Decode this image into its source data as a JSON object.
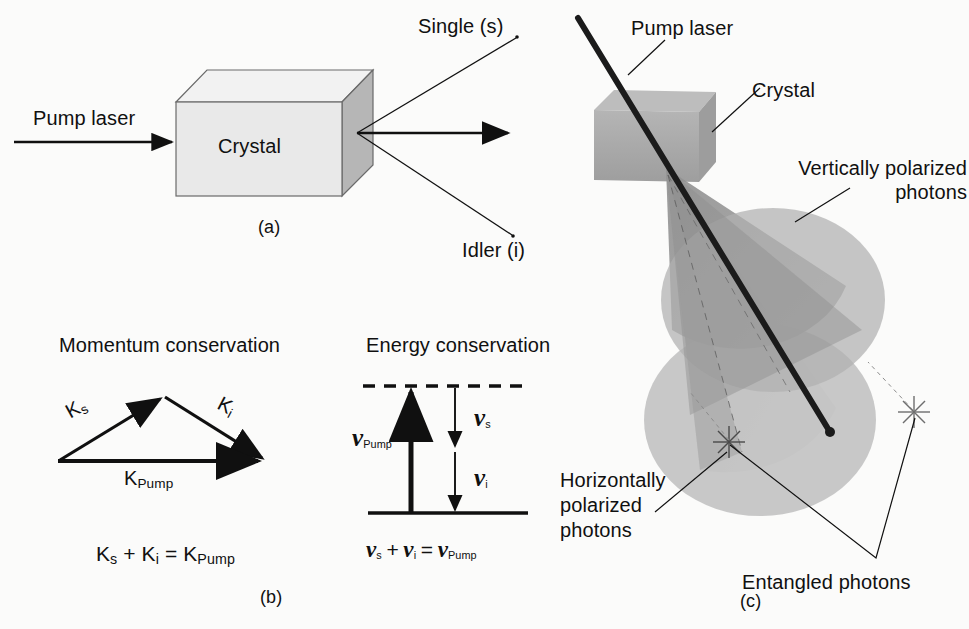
{
  "figure": {
    "panels": [
      "(a)",
      "(b)",
      "(c)"
    ],
    "colors": {
      "ink": "#101010",
      "crystal_front": "#e8e8e8",
      "crystal_top": "#f2f2f2",
      "crystal_side": "#b6b6b6",
      "crystal_3d": "#a9a9a9",
      "cone_light": "#c9c9c9",
      "cone_dark": "#9a9a9a",
      "background": "#fbfbfa"
    }
  },
  "panel_a": {
    "caption": "(a)",
    "pump_label": "Pump laser",
    "crystal_label": "Crystal",
    "signal_label": "Single (s)",
    "idler_label": "Idler (i)"
  },
  "panel_b": {
    "caption": "(b)",
    "momentum": {
      "heading": "Momentum conservation",
      "vector_signal": "K",
      "vector_signal_sub": "s",
      "vector_idler": "K",
      "vector_idler_sub": "i",
      "vector_pump": "K",
      "vector_pump_sub": "Pump",
      "equation": "K s  +  K i  =  K Pump",
      "equation_parts": {
        "a": "K",
        "a_sub": "s",
        "plus": "+",
        "b": "K",
        "b_sub": "i",
        "eq": "=",
        "c": "K",
        "c_sub": "Pump"
      }
    },
    "energy": {
      "heading": "Energy conservation",
      "arrow_up_label": "ν",
      "arrow_up_sub": "Pump",
      "arrow_down1_label": "ν",
      "arrow_down1_sub": "s",
      "arrow_down2_label": "ν",
      "arrow_down2_sub": "i",
      "equation_parts": {
        "a": "ν",
        "a_sub": "s",
        "plus": "+",
        "b": "ν",
        "b_sub": "i",
        "eq": "=",
        "c": "ν",
        "c_sub": "Pump"
      }
    }
  },
  "panel_c": {
    "caption": "(c)",
    "pump_label": "Pump laser",
    "crystal_label": "Crystal",
    "vertical_label_line1": "Vertically polarized",
    "vertical_label_line2": "photons",
    "horizontal_label_line1": "Horizontally",
    "horizontal_label_line2": "polarized",
    "horizontal_label_line3": "photons",
    "entangled_label": "Entangled photons"
  }
}
